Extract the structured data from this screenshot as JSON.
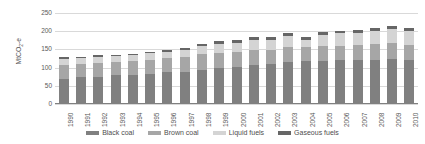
{
  "chart_data": {
    "type": "bar",
    "stacked": true,
    "title": "",
    "xlabel": "",
    "ylabel": "MtCO2-e",
    "ylabel_display": "MtCO₂-e",
    "ylim": [
      0,
      250
    ],
    "yticks": [
      0,
      50,
      100,
      150,
      200,
      250
    ],
    "grid": true,
    "legend_position": "bottom",
    "categories": [
      "1990",
      "1991",
      "1992",
      "1993",
      "1994",
      "1995",
      "1996",
      "1997",
      "1998",
      "1999",
      "2000",
      "2001",
      "2002",
      "2003",
      "2004",
      "2005",
      "2006",
      "2007",
      "2008",
      "2009",
      "2010"
    ],
    "series": [
      {
        "name": "Black coal",
        "color": "#808080",
        "values": [
          70,
          73,
          73,
          79,
          80,
          83,
          87,
          88,
          94,
          99,
          101,
          108,
          110,
          115,
          117,
          118,
          120,
          121,
          122,
          124,
          121
        ]
      },
      {
        "name": "Brown coal",
        "color": "#a6a6a6",
        "values": [
          38,
          36,
          39,
          36,
          37,
          38,
          39,
          40,
          43,
          42,
          41,
          40,
          39,
          41,
          41,
          41,
          40,
          41,
          42,
          43,
          42
        ]
      },
      {
        "name": "Liquid fuels",
        "color": "#d4d4d4",
        "values": [
          16,
          17,
          18,
          17,
          17,
          18,
          18,
          20,
          22,
          24,
          27,
          28,
          28,
          32,
          18,
          30,
          34,
          34,
          36,
          38,
          39
        ]
      },
      {
        "name": "Gaseous fuels",
        "color": "#666666",
        "values": [
          4,
          4,
          4,
          4,
          4,
          4,
          5,
          6,
          7,
          7,
          7,
          7,
          7,
          7,
          8,
          8,
          8,
          8,
          8,
          9,
          8
        ]
      }
    ],
    "totals": [
      128,
      130,
      134,
      136,
      138,
      143,
      149,
      154,
      166,
      172,
      176,
      183,
      184,
      195,
      184,
      197,
      202,
      204,
      208,
      214,
      210
    ]
  },
  "legend": {
    "items": [
      {
        "label": "Black coal",
        "color": "#808080"
      },
      {
        "label": "Brown coal",
        "color": "#a6a6a6"
      },
      {
        "label": "Liquid fuels",
        "color": "#d4d4d4"
      },
      {
        "label": "Gaseous fuels",
        "color": "#666666"
      }
    ]
  }
}
